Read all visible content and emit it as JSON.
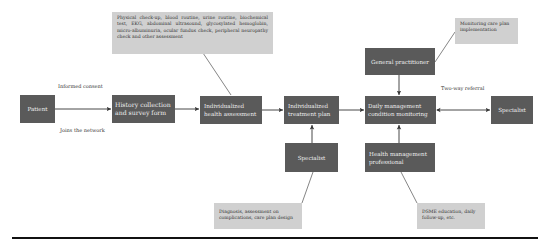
{
  "nodes": {
    "patient": "Patient",
    "history": "History collection and survey form",
    "health_assessment": "Individualized health assessment",
    "treatment_plan": "Individualized treatment plan",
    "daily_management": "Daily management condition monitoring",
    "specialist_right": "Specialist",
    "general_practitioner": "General practitioner",
    "specialist_bottom": "Specialist",
    "health_mgmt_professional": "Health management professional"
  },
  "notes": {
    "assessment_items": "Physical check-up, blood routine, urine routine, biochemical test, EKG, abdominal ultrasound, glycosylated hemoglobin, micro-albuminuria, ocular fundus check, peripheral neuropathy check and other assessment",
    "monitoring": "Monitoring care plan implementation",
    "diagnosis": "Diagnosis, assessment on complications, care plan design",
    "dsme": "DSME education, daily follow-up, etc."
  },
  "edge_labels": {
    "informed_consent": "Informed consent",
    "joins_network": "Joins the network",
    "two_way_referral": "Two-way referral"
  },
  "colors": {
    "node_fill": "#5a5a5a",
    "note_fill": "#d0d0d0",
    "edge": "#333333"
  }
}
